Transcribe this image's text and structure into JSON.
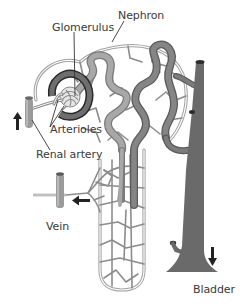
{
  "diagram": {
    "labels": {
      "glomerulus": "Glomerulus",
      "nephron": "Nephron",
      "arterioles": "Arterioles",
      "renal_artery": "Renal artery",
      "vein": "Vein",
      "bladder": "Bladder"
    },
    "colors": {
      "capillary": "#8c8c8c",
      "capillary_fill": "#d6d6d6",
      "tubule": "#9a9a9a",
      "tubule_dark": "#6e6e6e",
      "collecting_duct": "#666666",
      "glomerulus_ring": "#333333",
      "vessel": "#9b9b9b",
      "arrow": "#222222",
      "text": "#3a3a3a"
    },
    "arrows": [
      {
        "name": "renal-artery-flow",
        "direction": "up"
      },
      {
        "name": "vein-flow",
        "direction": "left"
      },
      {
        "name": "bladder-flow",
        "direction": "down"
      }
    ]
  }
}
